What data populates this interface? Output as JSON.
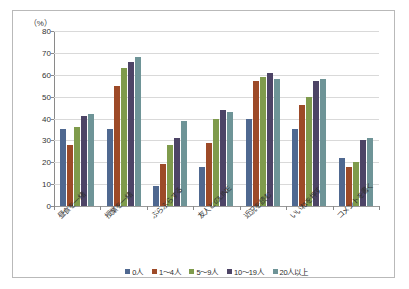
{
  "chart_data": {
    "type": "bar",
    "title": "",
    "subtitle": "",
    "xlabel": "",
    "ylabel": "",
    "unit_label": "（%）",
    "ylim": [
      0,
      80
    ],
    "ytick_step": 10,
    "yticks": [
      "0",
      "10",
      "20",
      "30",
      "40",
      "50",
      "60",
      "70",
      "80"
    ],
    "grid": true,
    "legend_position": "bottom",
    "categories": [
      "昼食を一緒",
      "授業を一緒",
      "ぶらぶらする",
      "友人とのLINE",
      "近況を読む",
      "いいねを押す",
      "コメントを書く"
    ],
    "series": [
      {
        "name": "0人",
        "color": "#4f6890",
        "values": [
          35,
          35,
          9,
          18,
          40,
          35,
          22
        ]
      },
      {
        "name": "1～4人",
        "color": "#9d4a28",
        "values": [
          28,
          55,
          19,
          29,
          57,
          46,
          18
        ]
      },
      {
        "name": "5～9人",
        "color": "#7f9b4c",
        "values": [
          36,
          63,
          28,
          40,
          59,
          50,
          20
        ]
      },
      {
        "name": "10～19人",
        "color": "#4d4466",
        "values": [
          41,
          66,
          31,
          44,
          61,
          57,
          30
        ]
      },
      {
        "name": "20人以上",
        "color": "#6e9497",
        "values": [
          42,
          68,
          39,
          43,
          58,
          58,
          31
        ]
      }
    ]
  },
  "legend": {
    "items": [
      {
        "label": "0人"
      },
      {
        "label": "1～4人"
      },
      {
        "label": "5～9人"
      },
      {
        "label": "10～19人"
      },
      {
        "label": "20人以上"
      }
    ]
  }
}
